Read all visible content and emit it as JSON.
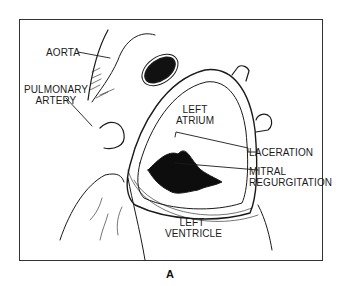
{
  "figure": {
    "panel_label": "A",
    "labels": {
      "aorta": "AORTA",
      "pulmonary_artery_1": "PULMONARY",
      "pulmonary_artery_2": "ARTERY",
      "left_atrium_1": "LEFT",
      "left_atrium_2": "ATRIUM",
      "laceration": "LACERATION",
      "mitral_1": "MITRAL",
      "mitral_2": "REGURGITATION",
      "left_ventricle_1": "LEFT",
      "left_ventricle_2": "VENTRICLE"
    }
  }
}
